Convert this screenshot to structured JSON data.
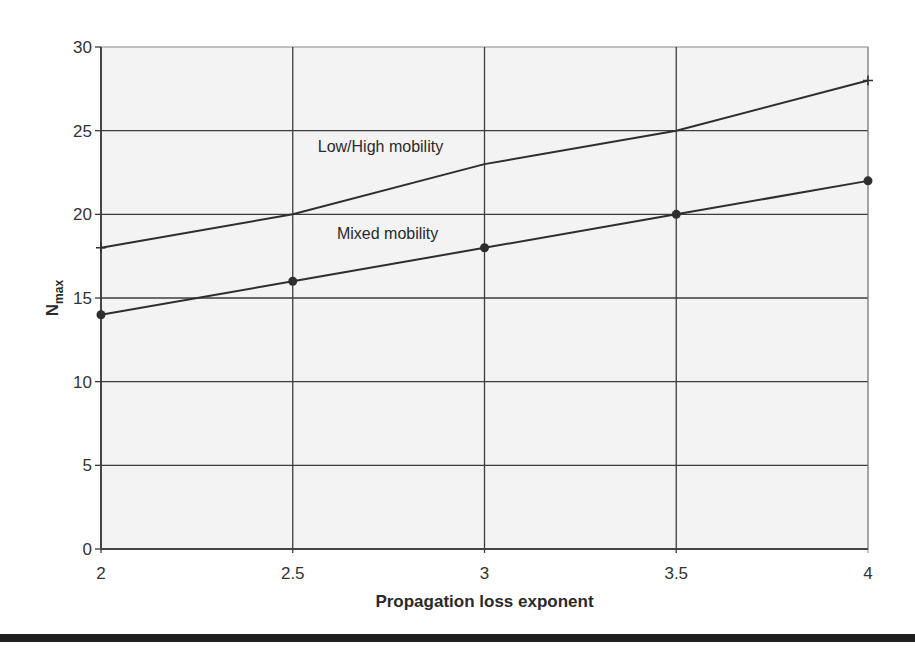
{
  "chart_data": {
    "type": "line",
    "title": "",
    "xlabel": "Propagation loss exponent",
    "ylabel": "N",
    "ylabel_subscript": "max",
    "x": [
      2,
      2.5,
      3,
      3.5,
      4
    ],
    "xlim": [
      2,
      4
    ],
    "ylim": [
      0,
      30
    ],
    "xticks": [
      "2",
      "2.5",
      "3",
      "3.5",
      "4"
    ],
    "yticks": [
      "0",
      "5",
      "10",
      "15",
      "20",
      "25",
      "30"
    ],
    "grid": true,
    "legend_position": "inline annotations",
    "series": [
      {
        "name": "Low/High mobility",
        "values": [
          18,
          20,
          23,
          25,
          28
        ],
        "marker": "plus",
        "label_pos": [
          2.5,
          23.7
        ]
      },
      {
        "name": "Mixed mobility",
        "values": [
          14,
          16,
          18,
          20,
          22
        ],
        "marker": "circle",
        "label_pos": [
          2.55,
          18.5
        ]
      }
    ]
  },
  "colors": {
    "plot_background": "#f3f3f3",
    "grid": "#3c3c3c",
    "line": "#2e2e2e",
    "bottom_rule": "#1e1e1e"
  }
}
